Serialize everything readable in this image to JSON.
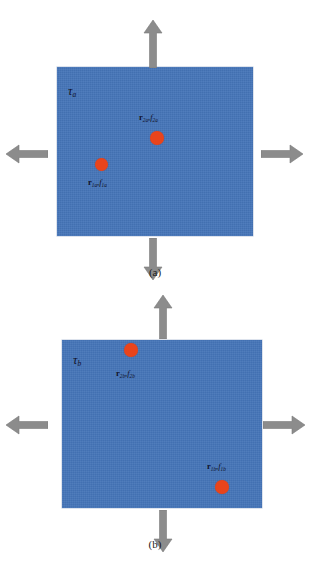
{
  "figure": {
    "type": "schematic-diagram",
    "colors": {
      "block_fill": "#4474b8",
      "inclusion": "#e8441c",
      "arrow": "#8c8c8c",
      "text": "#101028",
      "background": "#ffffff"
    }
  },
  "panels": [
    {
      "id": "a",
      "caption": "(a)",
      "traction_label": "τ",
      "traction_subscript": "a",
      "arrows": [
        {
          "name": "arrow-up",
          "direction": "up",
          "label": ""
        },
        {
          "name": "arrow-down",
          "direction": "down",
          "label": ""
        },
        {
          "name": "arrow-left",
          "direction": "left",
          "label": ""
        },
        {
          "name": "arrow-right",
          "direction": "right",
          "label": ""
        }
      ],
      "inclusions": [
        {
          "name": "inclusion-2a",
          "radius_symbol": "r",
          "force_symbol": "f",
          "subscript": "2a",
          "label": "r₂ₐ , f₂ₐ",
          "label_position": "above",
          "x_pct": 53,
          "y_pct": 38
        },
        {
          "name": "inclusion-1a",
          "radius_symbol": "r",
          "force_symbol": "f",
          "subscript": "1a",
          "label": "r₁ₐ , f₁ₐ",
          "label_position": "below",
          "x_pct": 25,
          "y_pct": 58
        }
      ]
    },
    {
      "id": "b",
      "caption": "(b)",
      "traction_label": "τ",
      "traction_subscript": "b",
      "arrows": [
        {
          "name": "arrow-up",
          "direction": "up",
          "label": ""
        },
        {
          "name": "arrow-down",
          "direction": "down",
          "label": ""
        },
        {
          "name": "arrow-left",
          "direction": "left",
          "label": ""
        },
        {
          "name": "arrow-right",
          "direction": "right",
          "label": ""
        }
      ],
      "inclusions": [
        {
          "name": "inclusion-2b",
          "radius_symbol": "r",
          "force_symbol": "f",
          "subscript": "2b",
          "label": "r₂ᵇ , f₂ᵇ",
          "label_position": "below",
          "x_pct": 34,
          "y_pct": 17
        },
        {
          "name": "inclusion-1b",
          "radius_symbol": "r",
          "force_symbol": "f",
          "subscript": "1b",
          "label": "r₁ᵇ , f₁ᵇ",
          "label_position": "above",
          "x_pct": 79,
          "y_pct": 86
        }
      ]
    }
  ],
  "labels": {
    "tau_a": "τ",
    "tau_a_sub": "a",
    "tau_b": "τ",
    "tau_b_sub": "b",
    "r2a": "r",
    "r2a_sub": "2a",
    "f2a": "f",
    "f2a_sub": "2a",
    "r1a": "r",
    "r1a_sub": "1a",
    "f1a": "f",
    "f1a_sub": "1a",
    "r2b": "r",
    "r2b_sub": "2b",
    "f2b": "f",
    "f2b_sub": "2b",
    "r1b": "r",
    "r1b_sub": "1b",
    "f1b": "f",
    "f1b_sub": "1b",
    "comma": ",",
    "caption_a": "(a)",
    "caption_b": "(b)"
  }
}
